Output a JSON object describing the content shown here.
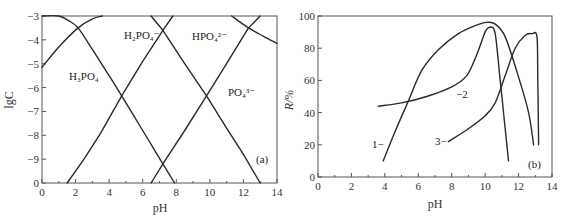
{
  "chart_data": [
    {
      "id": "a",
      "type": "line",
      "panel_label": "(a)",
      "xlabel": "pH",
      "ylabel": "lgC",
      "xlim": [
        0,
        14
      ],
      "ylim": [
        -10,
        -3
      ],
      "xticks": [
        "0",
        "2",
        "4",
        "6",
        "8",
        "10",
        "12",
        "14"
      ],
      "yticks": [
        "-3",
        "-4",
        "-5",
        "-6",
        "-7",
        "-8",
        "-9",
        "0"
      ],
      "grid": false,
      "series": [
        {
          "name": "H3PO4",
          "label": "H₃PO₄",
          "points": [
            [
              0.0,
              -3.0
            ],
            [
              1.0,
              -3.0
            ],
            [
              1.6,
              -3.2
            ],
            [
              2.15,
              -3.5
            ],
            [
              3.0,
              -4.4
            ],
            [
              4.0,
              -5.5
            ],
            [
              4.75,
              -6.35
            ],
            [
              6.0,
              -7.8
            ],
            [
              7.2,
              -9.2
            ],
            [
              7.9,
              -10.0
            ]
          ]
        },
        {
          "name": "H2PO4-",
          "label": "H₂PO₄⁻",
          "points": [
            [
              0.0,
              -5.15
            ],
            [
              1.0,
              -4.3
            ],
            [
              2.15,
              -3.5
            ],
            [
              3.0,
              -3.1
            ],
            [
              3.5,
              -3.0
            ],
            [
              6.5,
              -3.0
            ],
            [
              7.2,
              -3.0
            ],
            [
              6.0,
              -4.0
            ]
          ],
          "points_rising": [
            [
              1.5,
              -10.0
            ],
            [
              2.5,
              -9.0
            ],
            [
              3.5,
              -7.9
            ],
            [
              4.75,
              -6.35
            ],
            [
              6.0,
              -4.9
            ],
            [
              7.2,
              -3.6
            ],
            [
              7.8,
              -3.0
            ]
          ],
          "points_falling": [
            [
              6.5,
              -3.0
            ],
            [
              7.2,
              -3.6
            ],
            [
              8.5,
              -5.0
            ],
            [
              9.8,
              -6.35
            ],
            [
              11.0,
              -7.7
            ],
            [
              12.0,
              -8.8
            ],
            [
              13.0,
              -10.0
            ]
          ]
        },
        {
          "name": "HPO4 2-",
          "label": "HPO₄²⁻",
          "points_rising": [
            [
              6.5,
              -10.0
            ],
            [
              7.2,
              -9.2
            ],
            [
              8.5,
              -7.8
            ],
            [
              9.8,
              -6.35
            ],
            [
              11.0,
              -5.0
            ],
            [
              12.3,
              -3.5
            ],
            [
              13.0,
              -3.0
            ]
          ],
          "points_cap": [
            [
              11.3,
              -3.0
            ],
            [
              12.3,
              -3.5
            ],
            [
              13.2,
              -3.85
            ],
            [
              14.0,
              -4.15
            ]
          ]
        },
        {
          "name": "PO4 3-",
          "label": "PO₄³⁻",
          "points": [
            [
              6.5,
              -10.0
            ],
            [
              9.8,
              -6.35
            ],
            [
              12.3,
              -3.5
            ],
            [
              13.0,
              -3.0
            ]
          ]
        }
      ],
      "annotations": [
        "H₃PO₄",
        "H₂PO₄⁻",
        "HPO₄²⁻",
        "PO₄³⁻",
        "(a)"
      ]
    },
    {
      "id": "b",
      "type": "line",
      "panel_label": "(b)",
      "xlabel": "pH",
      "ylabel": "R/%",
      "xlim": [
        0,
        14
      ],
      "ylim": [
        0,
        100
      ],
      "xticks": [
        "0",
        "2",
        "4",
        "6",
        "8",
        "10",
        "12",
        "14"
      ],
      "yticks": [
        "0",
        "20",
        "40",
        "60",
        "80",
        "100"
      ],
      "grid": false,
      "series": [
        {
          "name": "1",
          "label": "1",
          "points": [
            [
              3.9,
              10
            ],
            [
              4.6,
              28
            ],
            [
              5.4,
              47
            ],
            [
              6.2,
              66
            ],
            [
              7.2,
              79
            ],
            [
              8.4,
              89
            ],
            [
              9.4,
              94
            ],
            [
              10.1,
              96
            ],
            [
              10.6,
              95
            ],
            [
              11.2,
              87
            ],
            [
              12.0,
              62
            ],
            [
              12.6,
              40
            ],
            [
              12.9,
              20
            ]
          ]
        },
        {
          "name": "2",
          "label": "2",
          "points": [
            [
              3.6,
              44
            ],
            [
              5.0,
              46
            ],
            [
              6.5,
              50
            ],
            [
              8.0,
              56
            ],
            [
              8.9,
              63
            ],
            [
              9.5,
              76
            ],
            [
              10.0,
              90
            ],
            [
              10.3,
              93
            ],
            [
              10.6,
              89
            ],
            [
              10.9,
              60
            ],
            [
              11.2,
              30
            ],
            [
              11.4,
              10
            ]
          ]
        },
        {
          "name": "3",
          "label": "3",
          "points": [
            [
              7.8,
              22
            ],
            [
              9.0,
              30
            ],
            [
              10.0,
              38
            ],
            [
              10.6,
              46
            ],
            [
              11.2,
              63
            ],
            [
              11.8,
              80
            ],
            [
              12.4,
              88
            ],
            [
              12.8,
              89
            ],
            [
              13.1,
              87
            ],
            [
              13.15,
              60
            ],
            [
              13.2,
              20
            ]
          ]
        }
      ],
      "annotations": [
        "1",
        "2",
        "3",
        "(b)"
      ]
    }
  ],
  "panels": {
    "a": {
      "label": "(a)",
      "xlabel": "pH",
      "ylabel": "lgC",
      "species": {
        "h3po4": "H₃PO₄",
        "h2po4": "H₂PO₄⁻",
        "hpo4": "HPO₄²⁻",
        "po4": "PO₄³⁻"
      }
    },
    "b": {
      "label": "(b)",
      "xlabel": "pH",
      "ylabel": "R/%",
      "curves": {
        "c1": "1−",
        "c2": "−2",
        "c3": "3−"
      }
    }
  }
}
